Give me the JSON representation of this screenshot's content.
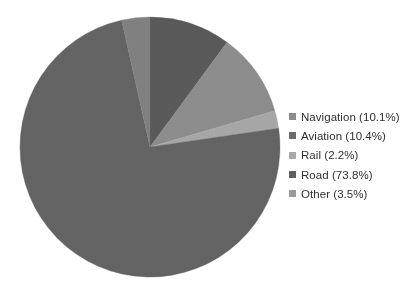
{
  "chart_data": {
    "type": "pie",
    "title": "",
    "subtitle": "",
    "xlabel": "",
    "ylabel": "",
    "legend_position": "right",
    "grid": false,
    "start_angle_deg": 0,
    "direction": "clockwise",
    "categories": [
      "Navigation",
      "Aviation",
      "Rail",
      "Road",
      "Other"
    ],
    "values": [
      10.1,
      10.4,
      2.2,
      73.8,
      3.5
    ],
    "value_unit": "%",
    "slices": [
      {
        "label": "Navigation",
        "value": 10.1,
        "legend_text": "Navigation (10.1%)",
        "color": "#595959"
      },
      {
        "label": "Aviation",
        "value": 10.4,
        "legend_text": "Aviation (10.4%)",
        "color": "#8c8c8c"
      },
      {
        "label": "Rail",
        "value": 2.2,
        "legend_text": "Rail (2.2%)",
        "color": "#a6a6a6"
      },
      {
        "label": "Road",
        "value": 73.8,
        "legend_text": "Road (73.8%)",
        "color": "#636363"
      },
      {
        "label": "Other",
        "value": 3.5,
        "legend_text": "Other (3.5%)",
        "color": "#808080"
      }
    ]
  },
  "legend": {
    "items": [
      {
        "label": "Navigation (10.1%)",
        "color": "#8c8c8c"
      },
      {
        "label": "Aviation (10.4%)",
        "color": "#6b6b6b"
      },
      {
        "label": "Rail (2.2%)",
        "color": "#a8a8a8"
      },
      {
        "label": "Road (73.8%)",
        "color": "#5e5e5e"
      },
      {
        "label": "Other (3.5%)",
        "color": "#9a9a9a"
      }
    ]
  },
  "geometry": {
    "center_x": 150,
    "center_y": 147,
    "radius": 130
  },
  "colors": {
    "background": "#ffffff",
    "text": "#2f2f2f"
  }
}
